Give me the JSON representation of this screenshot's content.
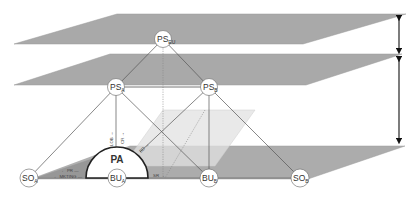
{
  "diagram": {
    "colors": {
      "background": "#ffffff",
      "plane_top": "#a9a9a9",
      "plane_middle": "#a9a9a9",
      "plane_bottom": "#acacac",
      "plane_translucent": "#dcdcdc",
      "line": "#555555",
      "node_fill": "#ffffff",
      "node_stroke": "#777777",
      "arrow": "#111111"
    },
    "planes": [
      {
        "id": "top-plane",
        "label": ""
      },
      {
        "id": "middle-plane",
        "label": ""
      },
      {
        "id": "bottom-plane",
        "label": ""
      },
      {
        "id": "translucent-plane",
        "label": ""
      }
    ],
    "nodes": {
      "ps_eu": {
        "main": "PS",
        "sub": "EU"
      },
      "ps_a": {
        "main": "PS",
        "sub": "A"
      },
      "ps_b": {
        "main": "PS",
        "sub": "B"
      },
      "so_a": {
        "main": "SO",
        "sub": "A"
      },
      "bu_a": {
        "main": "BU",
        "sub": "A"
      },
      "bu_b": {
        "main": "BU",
        "sub": "B"
      },
      "so_b": {
        "main": "SO",
        "sub": "B"
      }
    },
    "pa": {
      "label": "PA"
    },
    "flow_labels": {
      "pr": "← PR —",
      "mkting": "← MKTING —",
      "lob": "LOB →",
      "cr": "CR →",
      "bd": "BD →",
      "sr": "SR →"
    },
    "level_arrows": [
      {
        "id": "top-to-middle",
        "label": ""
      },
      {
        "id": "middle-to-bottom",
        "label": ""
      }
    ]
  }
}
